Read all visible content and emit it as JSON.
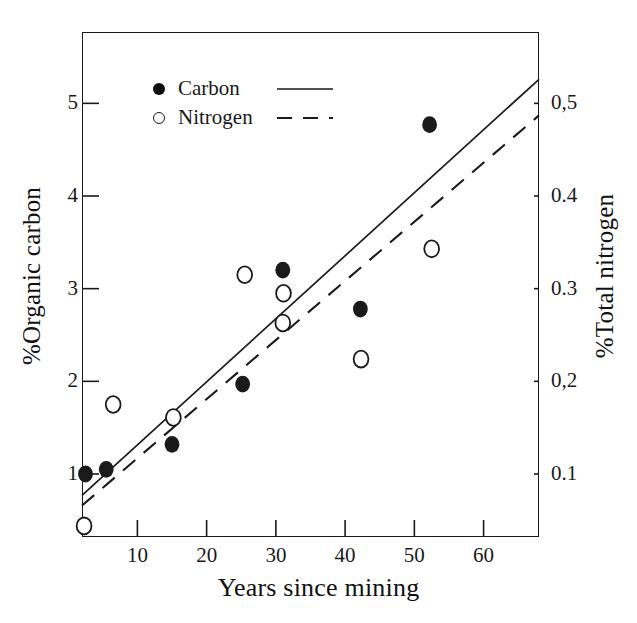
{
  "chart_data": {
    "type": "scatter",
    "title": "",
    "xlabel": "Years since mining",
    "ylabel": "%Organic carbon",
    "y2label": "%Total nitrogen",
    "xlim": [
      2,
      68
    ],
    "ylim": [
      0.32,
      5.77
    ],
    "y2lim": [
      0.032,
      0.577
    ],
    "grid": false,
    "legend_position": "top-left",
    "xticks": [
      10,
      20,
      30,
      40,
      50,
      60
    ],
    "xtick_labels": [
      "10",
      "20",
      "30",
      "40",
      "50",
      "60"
    ],
    "yticks": [
      1,
      2,
      3,
      4,
      5
    ],
    "ytick_labels": [
      "1",
      "2",
      "3",
      "4",
      "5"
    ],
    "y2ticks": [
      0.1,
      0.2,
      0.3,
      0.4,
      0.5
    ],
    "y2tick_labels": [
      "0.1",
      "0,2",
      "0.3",
      "0.4",
      "0,5"
    ],
    "series": [
      {
        "name": "Carbon",
        "marker": "filled-circle",
        "axis": "left",
        "points": [
          {
            "x": 2.5,
            "y": 1.0
          },
          {
            "x": 5.5,
            "y": 1.05
          },
          {
            "x": 15.0,
            "y": 1.32
          },
          {
            "x": 25.2,
            "y": 1.97
          },
          {
            "x": 31.0,
            "y": 3.2
          },
          {
            "x": 42.2,
            "y": 2.78
          },
          {
            "x": 52.2,
            "y": 4.77
          }
        ]
      },
      {
        "name": "Nitrogen",
        "marker": "open-circle",
        "axis": "right",
        "points": [
          {
            "x": 2.3,
            "y": 0.044
          },
          {
            "x": 6.5,
            "y": 0.175
          },
          {
            "x": 15.2,
            "y": 0.161
          },
          {
            "x": 25.5,
            "y": 0.315
          },
          {
            "x": 31.1,
            "y": 0.295
          },
          {
            "x": 31.0,
            "y": 0.263
          },
          {
            "x": 42.3,
            "y": 0.224
          },
          {
            "x": 52.5,
            "y": 0.343
          }
        ]
      }
    ],
    "fit_lines": [
      {
        "name": "Carbon regression",
        "style": "solid",
        "axis": "left",
        "x_start": 2,
        "y_start": 0.77,
        "x_end": 68,
        "y_end": 5.26
      },
      {
        "name": "Nitrogen regression",
        "style": "dashed",
        "axis": "right",
        "x_start": 2,
        "y_start": 0.066,
        "x_end": 68,
        "y_end": 0.487
      }
    ]
  },
  "legend": {
    "items": [
      {
        "label": "Carbon",
        "marker": "filled-circle",
        "line": "solid"
      },
      {
        "label": "Nitrogen",
        "marker": "open-circle",
        "line": "dashed"
      }
    ]
  },
  "style": {
    "ink": "#1a1a1a",
    "background": "#ffffff"
  }
}
